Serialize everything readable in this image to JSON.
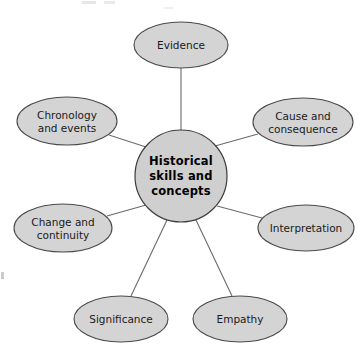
{
  "diagram": {
    "type": "spider-web-concept-map",
    "center": {
      "label": "Historical skills and concepts",
      "lines": [
        "Historical",
        "skills and",
        "concepts"
      ],
      "shape": "circle",
      "cx": 181,
      "cy": 176,
      "r": 46
    },
    "node_fill": "#d4d4d4",
    "node_stroke": "#4a4a4a",
    "center_fill": "#cfcfcf",
    "connector_color": "#6b6b6b",
    "background": "#ffffff",
    "nodes": [
      {
        "id": "evidence",
        "label": "Evidence",
        "lines": [
          "Evidence"
        ],
        "cx": 181,
        "cy": 45,
        "rx": 47,
        "ry": 23,
        "position": "top"
      },
      {
        "id": "cause-and-consequence",
        "label": "Cause and consequence",
        "lines": [
          "Cause and",
          "consequence"
        ],
        "cx": 303,
        "cy": 122,
        "rx": 50,
        "ry": 24,
        "position": "upper-right"
      },
      {
        "id": "interpretation",
        "label": "Interpretation",
        "lines": [
          "Interpretation"
        ],
        "cx": 306,
        "cy": 228,
        "rx": 48,
        "ry": 23,
        "position": "lower-right"
      },
      {
        "id": "empathy",
        "label": "Empathy",
        "lines": [
          "Empathy"
        ],
        "cx": 240,
        "cy": 319,
        "rx": 47,
        "ry": 23,
        "position": "bottom-right"
      },
      {
        "id": "significance",
        "label": "Significance",
        "lines": [
          "Significance"
        ],
        "cx": 121,
        "cy": 319,
        "rx": 47,
        "ry": 23,
        "position": "bottom-left"
      },
      {
        "id": "change-and-continuity",
        "label": "Change and continuity",
        "lines": [
          "Change and",
          "continuity"
        ],
        "cx": 63,
        "cy": 228,
        "rx": 49,
        "ry": 24,
        "position": "lower-left"
      },
      {
        "id": "chronology-and-events",
        "label": "Chronology and events",
        "lines": [
          "Chronology",
          "and events"
        ],
        "cx": 67,
        "cy": 121,
        "rx": 50,
        "ry": 24,
        "position": "upper-left"
      }
    ],
    "connectors": [
      {
        "id": "center-to-evidence",
        "from": "center",
        "to": "evidence",
        "x1": 181,
        "y1": 130,
        "x2": 181,
        "y2": 68
      },
      {
        "id": "center-to-cause-and-consequence",
        "from": "center",
        "to": "cause-and-consequence",
        "x1": 215,
        "y1": 146,
        "x2": 258,
        "y2": 134
      },
      {
        "id": "center-to-interpretation",
        "from": "center",
        "to": "interpretation",
        "x1": 217,
        "y1": 206,
        "x2": 262,
        "y2": 218
      },
      {
        "id": "center-to-empathy",
        "from": "center",
        "to": "empathy",
        "x1": 196,
        "y1": 220,
        "x2": 232,
        "y2": 296
      },
      {
        "id": "center-to-significance",
        "from": "center",
        "to": "significance",
        "x1": 167,
        "y1": 220,
        "x2": 131,
        "y2": 296
      },
      {
        "id": "center-to-change-and-continuity",
        "from": "center",
        "to": "change-and-continuity",
        "x1": 146,
        "y1": 205,
        "x2": 107,
        "y2": 216
      },
      {
        "id": "center-to-chronology-and-events",
        "from": "center",
        "to": "chronology-and-events",
        "x1": 146,
        "y1": 147,
        "x2": 109,
        "y2": 135
      }
    ]
  }
}
